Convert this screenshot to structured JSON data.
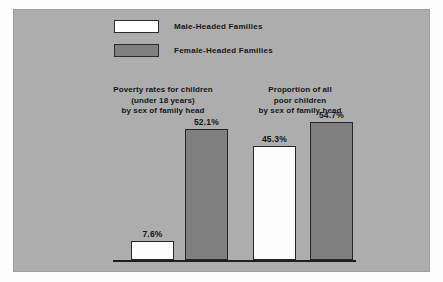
{
  "chart_data": {
    "type": "bar",
    "title": "",
    "subtitle": "",
    "xlabel": "",
    "ylabel": "",
    "ylim": [
      0,
      60
    ],
    "grid": false,
    "legend_position": "top-center",
    "categories": [
      "Poverty rates for children (under 18 years) by sex of family head",
      "Proportion of all poor children by sex of family head"
    ],
    "series": [
      {
        "name": "Male-Headed Families",
        "color": "#ffffff",
        "values": [
          7.6,
          45.3
        ]
      },
      {
        "name": "Female-Headed Families",
        "color": "#808080",
        "values": [
          52.1,
          54.7
        ]
      }
    ],
    "data_labels": [
      "7.6%",
      "52.1%",
      "45.3%",
      "54.7%"
    ]
  },
  "legend": {
    "items": [
      {
        "label": "Male-Headed Families",
        "swatch": "white-swatch"
      },
      {
        "label": "Female-Headed Families",
        "swatch": "gray-swatch"
      }
    ]
  },
  "groups": [
    {
      "caption_lines": [
        "Poverty rates for children",
        "(under 18 years)",
        "by sex of family head"
      ],
      "bars": [
        {
          "series": "Male-Headed Families",
          "value": 7.6,
          "label": "7.6%"
        },
        {
          "series": "Female-Headed Families",
          "value": 52.1,
          "label": "52.1%"
        }
      ]
    },
    {
      "caption_lines": [
        "Proportion of all",
        "poor children",
        "by sex of family head"
      ],
      "bars": [
        {
          "series": "Male-Headed Families",
          "value": 45.3,
          "label": "45.3%"
        },
        {
          "series": "Female-Headed Families",
          "value": 54.7,
          "label": "54.7%"
        }
      ]
    }
  ],
  "colors": {
    "page_background": "#fdfdfd",
    "panel_background": "#adadad",
    "bar_male": "#ffffff",
    "bar_female": "#808080",
    "bar_outline": "#262626",
    "axis_line": "#1d1f22",
    "text": "#14161a"
  }
}
